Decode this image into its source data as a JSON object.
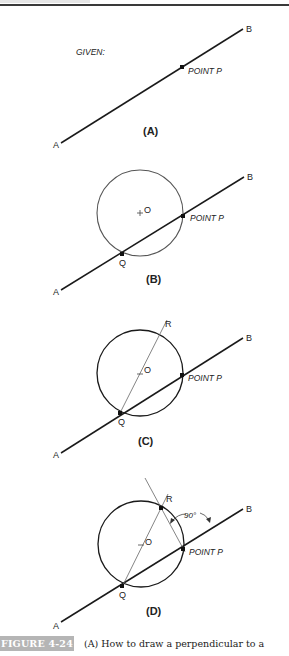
{
  "figure": {
    "number_label": "FIGURE 4-24",
    "caption": "(A) How to draw a perpendicular to a"
  },
  "panels": [
    {
      "id": "A",
      "label": "(A)",
      "given_label": "GIVEN:",
      "point_p_label": "POINT P",
      "end_a": "A",
      "end_b": "B"
    },
    {
      "id": "B",
      "label": "(B)",
      "point_p_label": "POINT P",
      "center_label": "O",
      "q_label": "Q",
      "end_a": "A",
      "end_b": "B"
    },
    {
      "id": "C",
      "label": "(C)",
      "point_p_label": "POINT P",
      "center_label": "O",
      "q_label": "Q",
      "r_label": "R",
      "end_a": "A",
      "end_b": "B"
    },
    {
      "id": "D",
      "label": "(D)",
      "point_p_label": "POINT P",
      "center_label": "O",
      "q_label": "Q",
      "r_label": "R",
      "angle_label": "90°",
      "end_a": "A",
      "end_b": "B"
    }
  ],
  "colors": {
    "line": "#1a1a1a",
    "circle_b": "#555555",
    "construction": "#666666",
    "badge_bg": "#b5b5b5"
  }
}
